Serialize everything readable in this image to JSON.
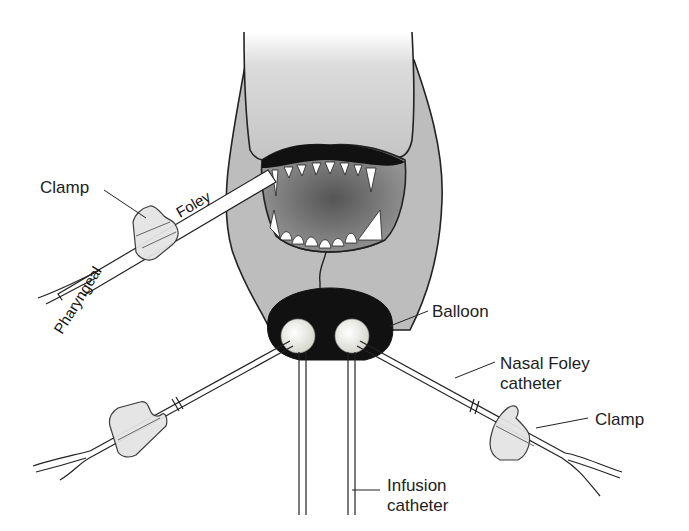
{
  "diagram": {
    "labels": {
      "clamp_top_left": "Clamp",
      "tube_foley": "Foley",
      "tube_pharyngeal": "Pharyngeal",
      "balloon": "Balloon",
      "nasal_foley_line1": "Nasal Foley",
      "nasal_foley_line2": "catheter",
      "clamp_right": "Clamp",
      "infusion_line1": "Infusion",
      "infusion_line2": "catheter"
    },
    "colors": {
      "head_fill": "#b8b8b8",
      "mouth_fill": "#7a7a7a",
      "nose_fill": "#111111",
      "balloon_fill": "#eeeeea",
      "clamp_fill": "#e6e6e6",
      "stroke": "#222222"
    }
  }
}
